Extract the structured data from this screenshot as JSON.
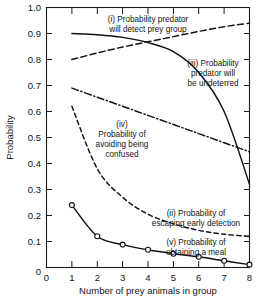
{
  "chart_data": {
    "type": "line",
    "title": "",
    "xlabel": "Number of prey animals in group",
    "ylabel": "Probability",
    "xlim": [
      0,
      8
    ],
    "ylim": [
      0,
      1.0
    ],
    "grid": false,
    "legend_position": "inline-annotations",
    "x_ticks": [
      "0",
      "1",
      "2",
      "3",
      "4",
      "5",
      "6",
      "7",
      "8"
    ],
    "y_ticks": [
      "0",
      "0.1",
      "0.2",
      "0.3",
      "0.4",
      "0.5",
      "0.6",
      "0.7",
      "0.8",
      "0.9",
      "1.0"
    ],
    "x": [
      1,
      2,
      3,
      4,
      5,
      6,
      7,
      8
    ],
    "series": [
      {
        "name": "(i) Probability predator will detect prey group",
        "id": "detect",
        "style": "solid",
        "markers": false,
        "values": [
          0.9,
          0.895,
          0.885,
          0.865,
          0.83,
          0.75,
          0.6,
          0.32
        ]
      },
      {
        "name": "(ii) Probability of escaping early detection",
        "id": "escape",
        "style": "dashed",
        "markers": false,
        "values": [
          0.62,
          0.38,
          0.27,
          0.205,
          0.168,
          0.143,
          0.128,
          0.12
        ]
      },
      {
        "name": "(iii) Probability predator will be undeterred",
        "id": "undeterred",
        "style": "dashed",
        "markers": false,
        "values": [
          0.8,
          0.825,
          0.848,
          0.868,
          0.888,
          0.908,
          0.926,
          0.94
        ]
      },
      {
        "name": "(iv) Probability of avoiding being confused",
        "id": "confusion",
        "style": "dash-dot",
        "markers": false,
        "values": [
          0.69,
          0.655,
          0.62,
          0.585,
          0.55,
          0.515,
          0.48,
          0.445
        ]
      },
      {
        "name": "(v) Probability of obtaining a meal",
        "id": "meal",
        "style": "solid",
        "markers": true,
        "values": [
          0.24,
          0.12,
          0.088,
          0.068,
          0.053,
          0.041,
          0.026,
          0.011
        ]
      }
    ],
    "annotations": [
      {
        "id": "annot-detect",
        "lines": [
          "(i) Probability predator",
          "will detect prey group"
        ],
        "anchor": "middle"
      },
      {
        "id": "annot-undeterred",
        "lines": [
          "(iii) Probability",
          "predator will",
          "be undeterred"
        ],
        "anchor": "middle"
      },
      {
        "id": "annot-confusion",
        "lines": [
          "(iv)",
          "Probability of",
          "avoiding being",
          "confused"
        ],
        "anchor": "middle"
      },
      {
        "id": "annot-escape",
        "lines": [
          "(ii) Probability of",
          "escaping early detection"
        ],
        "anchor": "middle"
      },
      {
        "id": "annot-meal",
        "lines": [
          "(v) Probability of",
          "obtaining a meal"
        ],
        "anchor": "middle"
      }
    ]
  }
}
